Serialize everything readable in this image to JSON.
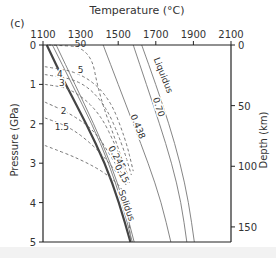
{
  "chart_data": {
    "type": "line",
    "panel_label": "(c)",
    "title": "",
    "xlabel": "Temperature (°C)",
    "ylabel": "Pressure (GPa)",
    "y2label": "Depth (km)",
    "xlim": [
      1100,
      2100
    ],
    "ylim": [
      0,
      5
    ],
    "y2lim": [
      0,
      160
    ],
    "x_ticks": [
      1100,
      1300,
      1500,
      1700,
      1900,
      2100
    ],
    "y_ticks": [
      0,
      1,
      2,
      3,
      4,
      5
    ],
    "y2_ticks": [
      0,
      50,
      100,
      150
    ],
    "grid": false,
    "series": [
      {
        "name": "Liquidus",
        "style": "solid",
        "color": "#777777",
        "points": [
          [
            1625,
            0
          ],
          [
            1700,
            1
          ],
          [
            1770,
            2
          ],
          [
            1830,
            3
          ],
          [
            1875,
            4
          ],
          [
            1905,
            5
          ]
        ]
      },
      {
        "name": "0.70",
        "style": "solid",
        "color": "#777777",
        "points": [
          [
            1580,
            0
          ],
          [
            1650,
            1
          ],
          [
            1720,
            2
          ],
          [
            1785,
            3
          ],
          [
            1835,
            4
          ],
          [
            1865,
            5
          ]
        ]
      },
      {
        "name": "0.438",
        "style": "solid",
        "color": "#777777",
        "points": [
          [
            1420,
            0
          ],
          [
            1500,
            1
          ],
          [
            1580,
            2
          ],
          [
            1660,
            3
          ],
          [
            1730,
            4
          ],
          [
            1780,
            5
          ]
        ]
      },
      {
        "name": "0.245",
        "style": "solid",
        "color": "#777777",
        "points": [
          [
            1170,
            0
          ],
          [
            1270,
            1
          ],
          [
            1370,
            2
          ],
          [
            1460,
            3
          ],
          [
            1530,
            4
          ],
          [
            1585,
            5
          ]
        ]
      },
      {
        "name": "0.15",
        "style": "solid",
        "color": "#777777",
        "points": [
          [
            1150,
            0
          ],
          [
            1255,
            1
          ],
          [
            1360,
            2
          ],
          [
            1450,
            3
          ],
          [
            1520,
            4
          ],
          [
            1575,
            5
          ]
        ]
      },
      {
        "name": "Solidus",
        "style": "solid-bold",
        "color": "#444444",
        "points": [
          [
            1120,
            0
          ],
          [
            1220,
            1
          ],
          [
            1330,
            2
          ],
          [
            1430,
            3
          ],
          [
            1505,
            4
          ],
          [
            1565,
            5
          ]
        ]
      },
      {
        "name": "50",
        "style": "dashed",
        "color": "#666666",
        "points": [
          [
            1130,
            0
          ],
          [
            1350,
            0.05
          ],
          [
            1400,
            1.3
          ],
          [
            1500,
            2.6
          ],
          [
            1560,
            3.5
          ]
        ]
      },
      {
        "name": "5",
        "style": "dashed",
        "color": "#666666",
        "points": [
          [
            1110,
            0.55
          ],
          [
            1300,
            0.7
          ],
          [
            1450,
            1.3
          ],
          [
            1540,
            2.4
          ],
          [
            1580,
            3.2
          ]
        ]
      },
      {
        "name": "4",
        "style": "dashed",
        "color": "#666666",
        "points": [
          [
            1110,
            0.75
          ],
          [
            1300,
            0.9
          ],
          [
            1430,
            1.5
          ],
          [
            1520,
            2.5
          ],
          [
            1570,
            3.3
          ]
        ]
      },
      {
        "name": "3",
        "style": "dashed",
        "color": "#666666",
        "points": [
          [
            1110,
            1.0
          ],
          [
            1250,
            1.1
          ],
          [
            1400,
            1.7
          ],
          [
            1500,
            2.7
          ],
          [
            1560,
            3.4
          ]
        ]
      },
      {
        "name": "2",
        "style": "dashed",
        "color": "#666666",
        "points": [
          [
            1110,
            1.45
          ],
          [
            1250,
            1.75
          ],
          [
            1380,
            2.2
          ],
          [
            1470,
            2.9
          ],
          [
            1550,
            3.5
          ]
        ]
      },
      {
        "name": "1.5",
        "style": "dashed",
        "color": "#666666",
        "points": [
          [
            1110,
            1.85
          ],
          [
            1250,
            2.1
          ],
          [
            1380,
            2.6
          ],
          [
            1470,
            3.1
          ],
          [
            1550,
            3.6
          ]
        ]
      },
      {
        "name": "1",
        "style": "dashed",
        "color": "#666666",
        "points": [
          [
            1110,
            2.55
          ],
          [
            1300,
            2.9
          ],
          [
            1450,
            3.3
          ],
          [
            1550,
            3.8
          ],
          [
            1565,
            5
          ]
        ]
      }
    ],
    "annotations": [
      {
        "text": "Liquidus",
        "x": 1725,
        "y": 0.8
      },
      {
        "text": "0.70",
        "x": 1700,
        "y": 1.6
      },
      {
        "text": "0.438",
        "x": 1590,
        "y": 2.1
      },
      {
        "text": "0.245",
        "x": 1480,
        "y": 2.9
      },
      {
        "text": "0.15",
        "x": 1505,
        "y": 3.3
      },
      {
        "text": "Solidus",
        "x": 1530,
        "y": 4.1
      },
      {
        "text": "50",
        "x": 1300,
        "y": 0.05
      },
      {
        "text": "5",
        "x": 1300,
        "y": 0.7
      },
      {
        "text": "4",
        "x": 1190,
        "y": 0.8
      },
      {
        "text": "3",
        "x": 1200,
        "y": 1.05
      },
      {
        "text": "2",
        "x": 1210,
        "y": 1.75
      },
      {
        "text": "1.5",
        "x": 1200,
        "y": 2.15
      }
    ]
  }
}
